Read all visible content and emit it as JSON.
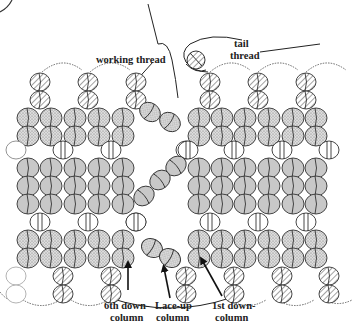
{
  "diagram": {
    "type": "beadwork-stitch-diagram",
    "labels": {
      "working_thread": "working thread",
      "tail_thread_1": "tail",
      "tail_thread_2": "thread",
      "sixth_down_1": "6th down-",
      "sixth_down_2": "column",
      "laceup_1": "Lace-up",
      "laceup_2": "column",
      "first_down_1": "1st down-",
      "first_down_2": "column"
    },
    "colors": {
      "stroke": "#333333",
      "gray_bead": "#c8c8c8",
      "stipple_bg": "#d9d9d9",
      "stipple_dot": "#7a7a7a",
      "hatch": "#555555",
      "clear_bead": "#ffffff"
    },
    "bead_types": [
      "hatched",
      "stippled",
      "clear",
      "solid-gray"
    ],
    "left_columns_x": [
      28,
      51,
      75,
      99,
      123
    ],
    "right_columns_x": [
      199,
      222,
      245,
      269,
      293,
      316
    ]
  }
}
